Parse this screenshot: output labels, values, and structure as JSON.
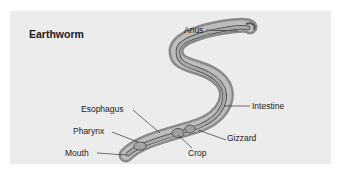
{
  "diagram": {
    "title": "Earthworm",
    "labels": {
      "anus": "Anus",
      "intestine": "Intestine",
      "esophagus": "Esophagus",
      "gizzard": "Gizzard",
      "pharynx": "Pharynx",
      "crop": "Crop",
      "mouth": "Mouth"
    }
  },
  "colors": {
    "background": "#ececec",
    "body_outer": "#8e8e8e",
    "body_inner": "#b8b8b8",
    "gut": "#a6a6a6",
    "leader_line": "#333333"
  }
}
